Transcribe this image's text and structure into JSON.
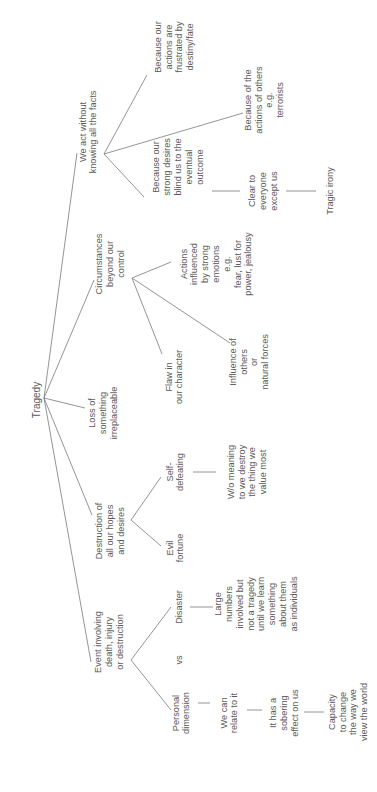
{
  "diagram": {
    "type": "mind-map",
    "orientation": "rotated -90deg (reads bottom-to-top)",
    "root": {
      "id": "tragedy",
      "label": "Tragedy"
    },
    "nodes": [
      {
        "id": "event",
        "lines": [
          "Event involving",
          "death, injury",
          "or destruction"
        ]
      },
      {
        "id": "destruction",
        "lines": [
          "Destruction of",
          "all our hopes",
          "and desires"
        ]
      },
      {
        "id": "loss",
        "lines": [
          "Loss of",
          "something",
          "irreplaceable"
        ]
      },
      {
        "id": "circumstances",
        "lines": [
          "Circumstances",
          "beyond our",
          "control"
        ]
      },
      {
        "id": "act",
        "lines": [
          "We act without",
          "knowing all the facts"
        ]
      },
      {
        "id": "personal",
        "lines": [
          "Personal",
          "dimension"
        ]
      },
      {
        "id": "vs",
        "lines": [
          "vs"
        ]
      },
      {
        "id": "disaster",
        "lines": [
          "Disaster"
        ]
      },
      {
        "id": "relate",
        "lines": [
          "We can",
          "relate to it"
        ]
      },
      {
        "id": "sobering",
        "lines": [
          "It has a",
          "sobering",
          "effect on us"
        ]
      },
      {
        "id": "capacity",
        "lines": [
          "Capacity",
          "to change",
          "the way we",
          "view the world"
        ]
      },
      {
        "id": "large",
        "lines": [
          "Large",
          "numbers",
          "involved but",
          "not a tragedy",
          "until we learn",
          "something",
          "about them",
          "as individuals"
        ]
      },
      {
        "id": "evil",
        "lines": [
          "Evil",
          "fortune"
        ]
      },
      {
        "id": "selfdef",
        "lines": [
          "Self-",
          "defeating"
        ]
      },
      {
        "id": "wo",
        "lines": [
          "W/o meaning",
          "to we destroy",
          "the thing we",
          "value most"
        ]
      },
      {
        "id": "flaw",
        "lines": [
          "Flaw in",
          "our character"
        ]
      },
      {
        "id": "influence",
        "lines": [
          "Influence of",
          "others",
          "or",
          "natural forces"
        ]
      },
      {
        "id": "emotions",
        "lines": [
          "Actions",
          "influenced",
          "by strong",
          "emotions",
          "e.g.",
          "fear, lust for",
          "power, jealousy"
        ]
      },
      {
        "id": "blind",
        "lines": [
          "Because our",
          "strong desires",
          "blind us to  the",
          "eventual",
          "outcome"
        ]
      },
      {
        "id": "clear",
        "lines": [
          "Clear to",
          "everyone",
          "except us"
        ]
      },
      {
        "id": "irony",
        "lines": [
          "Tragic irony"
        ]
      },
      {
        "id": "others",
        "lines": [
          "Because of the",
          "actions of others",
          "e.g.",
          "terrorists"
        ]
      },
      {
        "id": "fate",
        "lines": [
          "Because our",
          "actions are",
          "frustrated by",
          "destiny/fate"
        ]
      }
    ],
    "edges": [
      [
        "tragedy",
        "event"
      ],
      [
        "tragedy",
        "destruction"
      ],
      [
        "tragedy",
        "loss"
      ],
      [
        "tragedy",
        "circumstances"
      ],
      [
        "tragedy",
        "act"
      ],
      [
        "event",
        "personal"
      ],
      [
        "event",
        "disaster"
      ],
      [
        "personal",
        "relate"
      ],
      [
        "relate",
        "sobering"
      ],
      [
        "sobering",
        "capacity"
      ],
      [
        "disaster",
        "large"
      ],
      [
        "destruction",
        "evil"
      ],
      [
        "destruction",
        "selfdef"
      ],
      [
        "selfdef",
        "wo"
      ],
      [
        "circumstances",
        "flaw"
      ],
      [
        "circumstances",
        "influence"
      ],
      [
        "circumstances",
        "emotions"
      ],
      [
        "act",
        "blind"
      ],
      [
        "act",
        "others"
      ],
      [
        "act",
        "fate"
      ],
      [
        "blind",
        "clear"
      ],
      [
        "clear",
        "irony"
      ]
    ],
    "colors": {
      "text": "#5a5a5a",
      "line": "#7a7a7a",
      "background": "#ffffff"
    }
  }
}
